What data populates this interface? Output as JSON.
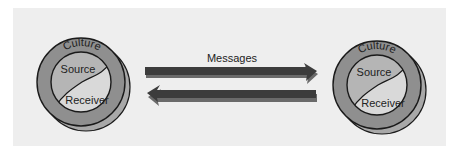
{
  "diagram": {
    "type": "communication-model",
    "colors": {
      "background": "#eeeeee",
      "culture_ring": "#8f8f8f",
      "ring_shadow": "#a8a8a8",
      "source_region": "#b5b5b5",
      "receiver_region": "#d9d9d9",
      "arrow": "#3c3c3c",
      "arrow_shadow": "#6a6a6a",
      "outline": "#1a1a1a"
    },
    "left_node": {
      "culture_label": "Culture",
      "source_label": "Source",
      "receiver_label": "Receiver"
    },
    "right_node": {
      "culture_label": "Culture",
      "source_label": "Source",
      "receiver_label": "Receiver"
    },
    "connection": {
      "label": "Messages",
      "arrows": [
        {
          "direction": "left-to-right"
        },
        {
          "direction": "right-to-left"
        }
      ]
    }
  }
}
